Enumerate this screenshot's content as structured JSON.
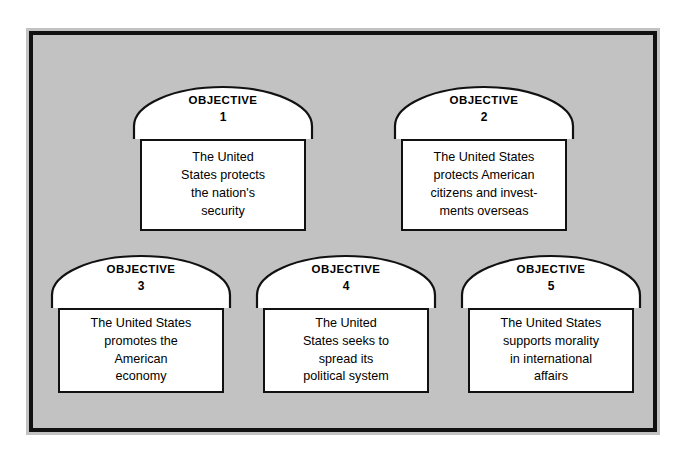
{
  "figure": {
    "background_color": "#c2c2c2",
    "frame_color": "#111111",
    "shape_fill": "#ffffff",
    "text_color": "#000000"
  },
  "objectives": [
    {
      "label": "OBJECTIVE",
      "number": "1",
      "text": "The United\nStates protects\nthe nation's\nsecurity"
    },
    {
      "label": "OBJECTIVE",
      "number": "2",
      "text": "The United States\nprotects American\ncitizens and invest-\nments overseas"
    },
    {
      "label": "OBJECTIVE",
      "number": "3",
      "text": "The United States\npromotes the\nAmerican\neconomy"
    },
    {
      "label": "OBJECTIVE",
      "number": "4",
      "text": "The United\nStates seeks to\nspread its\npolitical system"
    },
    {
      "label": "OBJECTIVE",
      "number": "5",
      "text": "The United States\nsupports morality\nin international\naffairs"
    }
  ]
}
